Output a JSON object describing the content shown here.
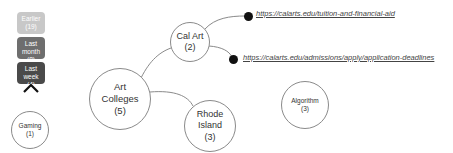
{
  "history_stack": {
    "items": [
      {
        "label": "Earlier",
        "count": "(19)",
        "color": "#c8c8c8"
      },
      {
        "label": "Last month",
        "count": "(8)",
        "color": "#6e6e6e"
      },
      {
        "label": "Last week",
        "count": "(4)",
        "color": "#4a4a4a"
      }
    ],
    "expand_icon": "chevron-up-icon",
    "current": {
      "label": "Gaming",
      "count": "(1)"
    }
  },
  "graph": {
    "nodes": [
      {
        "id": "art-colleges",
        "label": "Art Colleges",
        "line1": "Art",
        "line2": "Colleges",
        "count": "(5)"
      },
      {
        "id": "cal-art",
        "label": "Cal Art",
        "count": "(2)"
      },
      {
        "id": "rhode-island",
        "label": "Rhode Island",
        "line1": "Rhode",
        "line2": "Island",
        "count": "(3)"
      },
      {
        "id": "algorithm",
        "label": "Algorithm",
        "count": "(3)"
      }
    ],
    "links": [
      {
        "url": "https://calarts.edu/tuition-and-financial-aid"
      },
      {
        "url": "https://calarts.edu/admissions/apply/application-deadlines"
      }
    ],
    "edge_color": "#8a8a8a"
  }
}
